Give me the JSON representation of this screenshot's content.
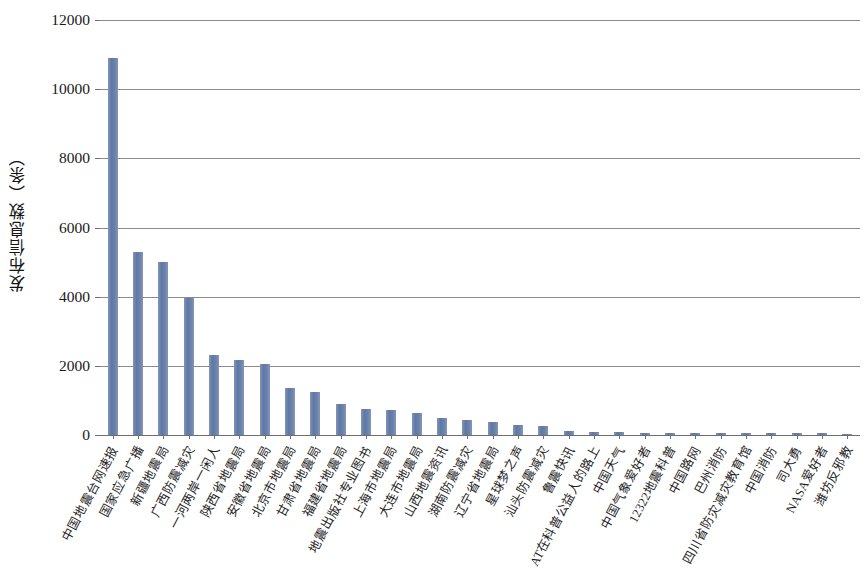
{
  "chart_data": {
    "type": "bar",
    "title": "",
    "xlabel": "",
    "ylabel": "发布信息数（条）",
    "ylim": [
      0,
      12000
    ],
    "ytick_labels": [
      "12000",
      "10000",
      "8000",
      "6000",
      "4000",
      "2000",
      "0"
    ],
    "ytick_values": [
      12000,
      10000,
      8000,
      6000,
      4000,
      2000,
      0
    ],
    "grid": true,
    "legend": "none",
    "bar_color": "#6d84ac",
    "axis_color": "#6e6e6e",
    "categories": [
      "中国地震台网速报",
      "国家应急广播",
      "新疆地震局",
      "广西防震减灾",
      "一河两岸一闲人",
      "陕西省地震局",
      "安徽省地震局",
      "北京市地震局",
      "甘肃省地震局",
      "福建省地震局",
      "地震出版社专业图书",
      "上海市地震局",
      "大连市地震局",
      "山西地震资讯",
      "湖南防震减灾",
      "辽宁省地震局",
      "星球梦之声",
      "汕头防震减灾",
      "鲁震快讯",
      "AT在科普公益人的路上",
      "中国天气",
      "中国气象爱好者",
      "12322地震科普",
      "中国路网",
      "巴州消防",
      "四川省防灾减灾教育馆",
      "中国消防",
      "司大勇",
      "NASA爱好者",
      "潍坊反邪教"
    ],
    "values": [
      10900,
      5280,
      5000,
      3970,
      2320,
      2160,
      2060,
      1360,
      1250,
      900,
      760,
      720,
      650,
      490,
      420,
      370,
      290,
      250,
      110,
      90,
      80,
      70,
      70,
      60,
      60,
      55,
      50,
      50,
      45,
      40
    ]
  }
}
